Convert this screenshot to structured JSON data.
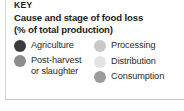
{
  "legend": {
    "key_word": "KEY",
    "title_line_1": "Cause and stage of food loss",
    "title_line_2": "(% of total production)",
    "left_column": [
      {
        "label": "Agriculture",
        "label_line_2": "",
        "swatch_color": "#3b3b3b",
        "swatch_name": "swatch-agriculture"
      },
      {
        "label": "Post-harvest",
        "label_line_2": "or slaughter",
        "swatch_color": "#8d8d8d",
        "swatch_name": "swatch-post-harvest-or-slaughter"
      }
    ],
    "right_column": [
      {
        "label": "Processing",
        "label_line_2": "",
        "swatch_color": "#c8c8c8",
        "swatch_name": "swatch-processing"
      },
      {
        "label": "Distribution",
        "label_line_2": "",
        "swatch_color": "#e4e4e4",
        "swatch_name": "swatch-distribution"
      },
      {
        "label": "Consumption",
        "label_line_2": "",
        "swatch_color": "#9c9c9c",
        "swatch_name": "swatch-consumption"
      }
    ]
  }
}
